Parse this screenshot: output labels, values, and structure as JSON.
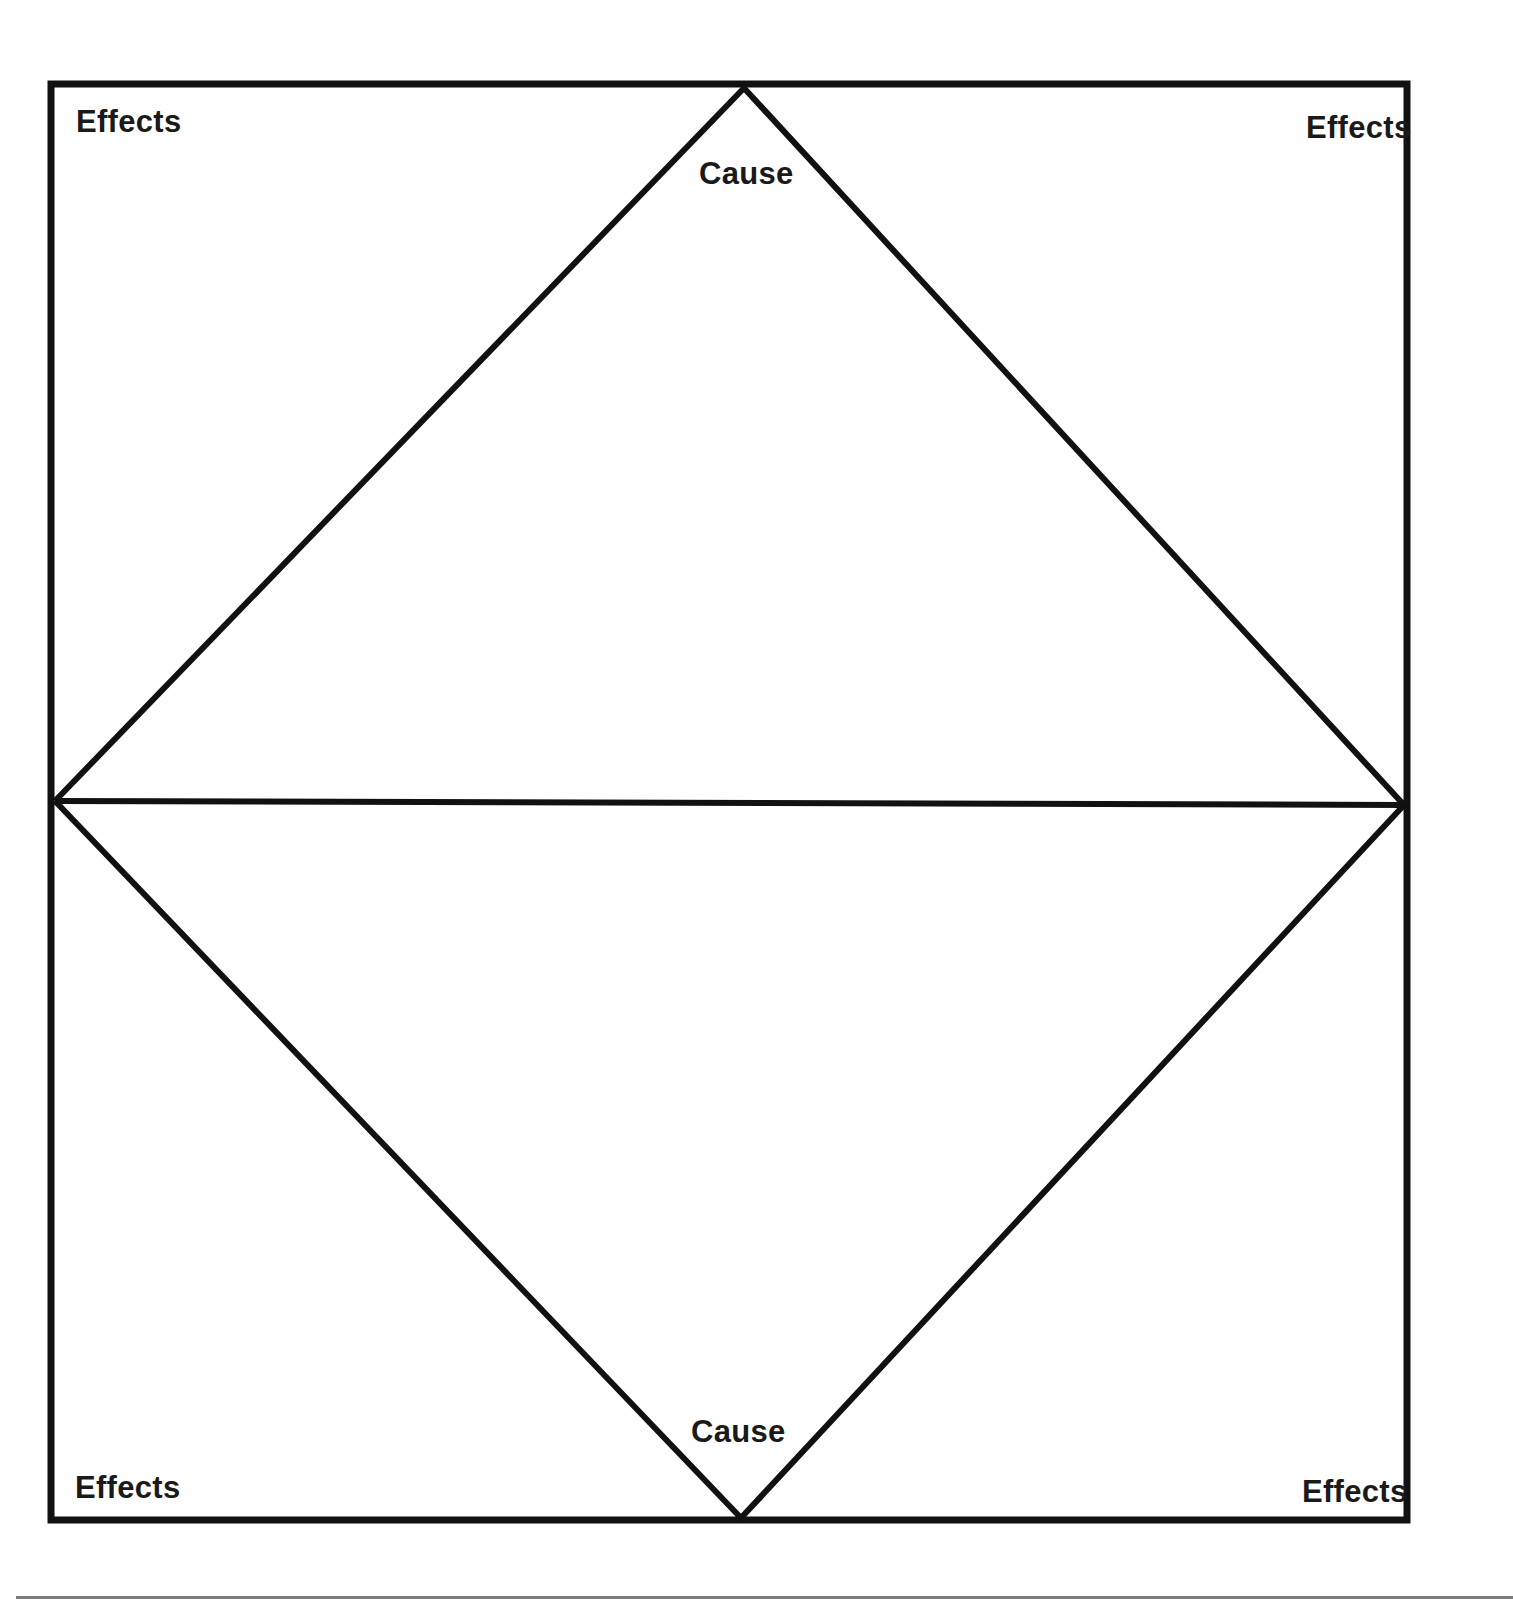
{
  "diagram": {
    "type": "cause-and-effect graphic organizer",
    "labels": {
      "effects_top_left": "Effects",
      "effects_top_right": "Effects",
      "effects_bottom_left": "Effects",
      "effects_bottom_right": "Effects",
      "cause_top": "Cause",
      "cause_bottom": "Cause"
    },
    "colors": {
      "line": "#111111",
      "text": "#1a1a1a",
      "background": "#ffffff"
    }
  }
}
